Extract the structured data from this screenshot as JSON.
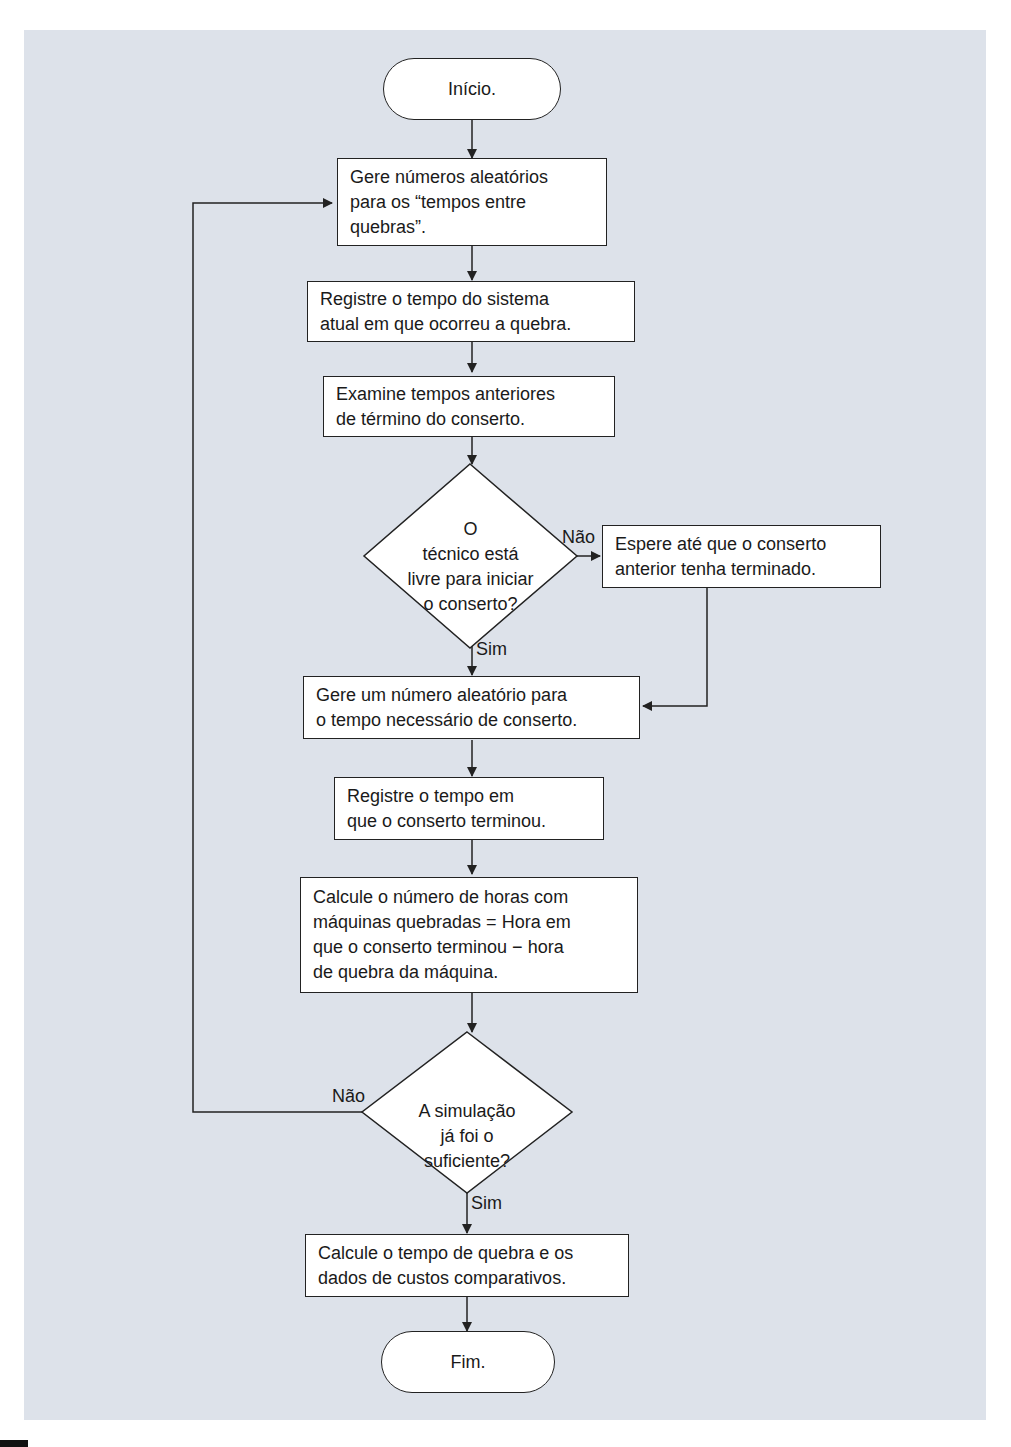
{
  "diagram": {
    "start": "Início.",
    "end": "Fim.",
    "steps": [
      "Gere números aleatórios\npara os “tempos entre\nquebras”.",
      "Registre o tempo do sistema\natual em que ocorreu a quebra.",
      "Examine tempos anteriores\nde término do conserto.",
      "Espere até que o conserto\nanterior tenha terminado.",
      "Gere um número aleatório para\no tempo necessário de conserto.",
      "Registre o tempo em\nque o conserto terminou.",
      "Calcule o número de horas com\nmáquinas quebradas = Hora em\nque o conserto terminou − hora\nde quebra da máquina.",
      "Calcule o tempo de quebra e os\ndados de custos comparativos."
    ],
    "decisions": [
      "O\ntécnico está\nlivre para iniciar\no conserto?",
      "A simulação\njá foi o\nsuficiente?"
    ],
    "edge_labels": {
      "d1_no": "Não",
      "d1_yes": "Sim",
      "d2_no": "Não",
      "d2_yes": "Sim"
    }
  },
  "colors": {
    "panel_bg": "#dde2ea",
    "node_bg": "#ffffff",
    "line": "#222222"
  }
}
